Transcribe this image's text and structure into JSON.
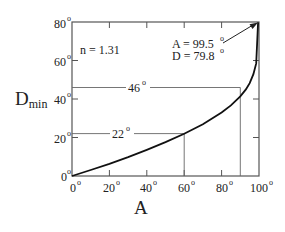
{
  "chart_data": {
    "type": "line",
    "title": "",
    "xlabel": "A",
    "ylabel": "D",
    "ylabel_subscript": "min",
    "xlim": [
      0,
      100
    ],
    "ylim": [
      0,
      80
    ],
    "x_ticks": [
      0,
      20,
      40,
      60,
      80,
      100
    ],
    "y_ticks": [
      0,
      20,
      40,
      60,
      80
    ],
    "x_tick_labels": [
      "0°",
      "20°",
      "40°",
      "60°",
      "80°",
      "100°"
    ],
    "y_tick_labels": [
      "0°",
      "20°",
      "40°",
      "60°",
      "80°"
    ],
    "grid": false,
    "legend": null,
    "series": [
      {
        "name": "Minimum deviation, n = 1.31",
        "x": [
          0,
          10,
          20,
          30,
          40,
          50,
          60,
          70,
          80,
          85,
          90,
          93,
          95,
          97,
          98.5,
          99.5
        ],
        "y": [
          0,
          3.1,
          6.3,
          9.8,
          13.6,
          17.6,
          21.9,
          26.9,
          33.0,
          36.7,
          41.4,
          45.0,
          48.2,
          52.9,
          58.5,
          79.8
        ]
      }
    ],
    "annotations": [
      {
        "text": "n = 1.31",
        "x": 8,
        "y": 66
      },
      {
        "text": "46°",
        "type": "hline",
        "y": 46,
        "x_end": 90,
        "vline_x": 90
      },
      {
        "text": "22°",
        "type": "hline",
        "y": 22,
        "x_end": 60,
        "vline_x": 60
      },
      {
        "text": "A = 99.5°",
        "x": 62,
        "y": 71,
        "arrow_to": [
          99.5,
          79.8
        ]
      },
      {
        "text": "D = 79.8°",
        "x": 62,
        "y": 64
      }
    ]
  },
  "labels": {
    "n_value": "n = 1.31",
    "line46": "46",
    "line22": "22",
    "annot_A": "A = 99.5",
    "annot_D": "D = 79.8",
    "xlabel": "A",
    "ylabel_main": "D",
    "ylabel_sub": "min",
    "deg": "°"
  }
}
